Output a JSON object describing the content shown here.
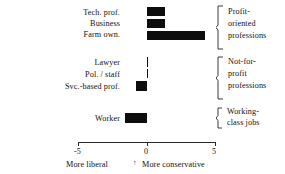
{
  "chart_data": {
    "type": "bar",
    "orientation": "horizontal",
    "title": "",
    "xlabel": "",
    "ylabel": "",
    "xlim": [
      -5,
      5
    ],
    "xticks": [
      -5,
      0,
      5
    ],
    "xtick_labels": [
      "-5",
      "0",
      "5"
    ],
    "grid": false,
    "legend": false,
    "axis_captions": {
      "left": "More liberal",
      "right": "More conservative",
      "center_marker": "↑"
    },
    "categories": [
      "Tech. prof.",
      "Business",
      "Farm own.",
      "Lawyer",
      "Pol. / staff",
      "Svc.-based prof.",
      "Worker"
    ],
    "values": [
      1.3,
      1.3,
      4.2,
      0.0,
      0.0,
      -0.8,
      -1.6
    ],
    "groups": [
      {
        "label": "Profit-oriented professions",
        "lines": [
          "Profit-",
          "oriented",
          "professions"
        ],
        "members": [
          "Tech. prof.",
          "Business",
          "Farm own."
        ]
      },
      {
        "label": "Not-for-profit professions",
        "lines": [
          "Not-for-",
          "profit",
          "professions"
        ],
        "members": [
          "Lawyer",
          "Pol. / staff",
          "Svc.-based prof."
        ]
      },
      {
        "label": "Working-class jobs",
        "lines": [
          "Working-",
          "class jobs"
        ],
        "members": [
          "Worker"
        ]
      }
    ],
    "colors": {
      "bar": "#0d0d0d",
      "axis": "#2a2a2a",
      "text": "#111111",
      "background": "#ffffff"
    }
  },
  "labels": {
    "cat0": "Tech. prof.",
    "cat1": "Business",
    "cat2": "Farm own.",
    "cat3": "Lawyer",
    "cat4": "Pol. / staff",
    "cat5": "Svc.-based prof.",
    "cat6": "Worker"
  },
  "ticks": {
    "t0": "-5",
    "t1": "0",
    "t2": "5"
  },
  "captions": {
    "left": "More liberal",
    "right": "More conservative",
    "marker": "↑"
  },
  "groups": {
    "g0l0": "Profit-",
    "g0l1": "oriented",
    "g0l2": "professions",
    "g1l0": "Not-for-",
    "g1l1": "profit",
    "g1l2": "professions",
    "g2l0": "Working-",
    "g2l1": "class jobs"
  }
}
